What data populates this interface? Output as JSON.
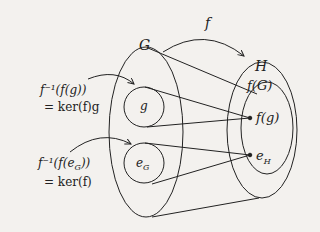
{
  "diagram": {
    "type": "set-mapping",
    "colors": {
      "background": "#f3f1ee",
      "ink": "#222222"
    },
    "map_label": "f",
    "domain_label": "G",
    "codomain_label": "H",
    "image_label": "f(G)",
    "elements": {
      "g": "g",
      "e_G": "e",
      "e_G_sub": "G",
      "f_g": "f(g)",
      "e_H": "e",
      "e_H_sub": "H"
    },
    "annotations": {
      "preimage_g_line1": "f⁻¹(f(g))",
      "preimage_g_line2": "= ker(f)g",
      "preimage_e_line1_pre": "f⁻¹(f(e",
      "preimage_e_line1_sub": "G",
      "preimage_e_line1_post": "))",
      "preimage_e_line2": "= ker(f)"
    }
  }
}
